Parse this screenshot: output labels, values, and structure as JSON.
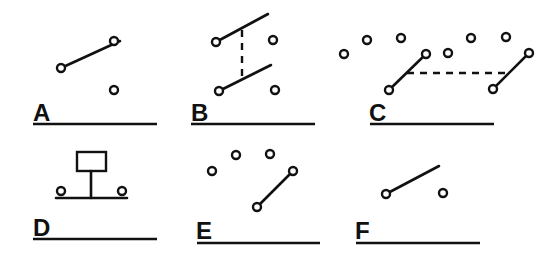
{
  "figure": {
    "panels": [
      {
        "id": "A",
        "label": "A",
        "type": "single-pole double-throw switch"
      },
      {
        "id": "B",
        "label": "B",
        "type": "ganged double-pole switch"
      },
      {
        "id": "C",
        "label": "C",
        "type": "ganged multi-position rotary switch"
      },
      {
        "id": "D",
        "label": "D",
        "type": "push-button switch"
      },
      {
        "id": "E",
        "label": "E",
        "type": "rotary selector switch"
      },
      {
        "id": "F",
        "label": "F",
        "type": "single-pole single-throw switch (open)"
      }
    ]
  }
}
